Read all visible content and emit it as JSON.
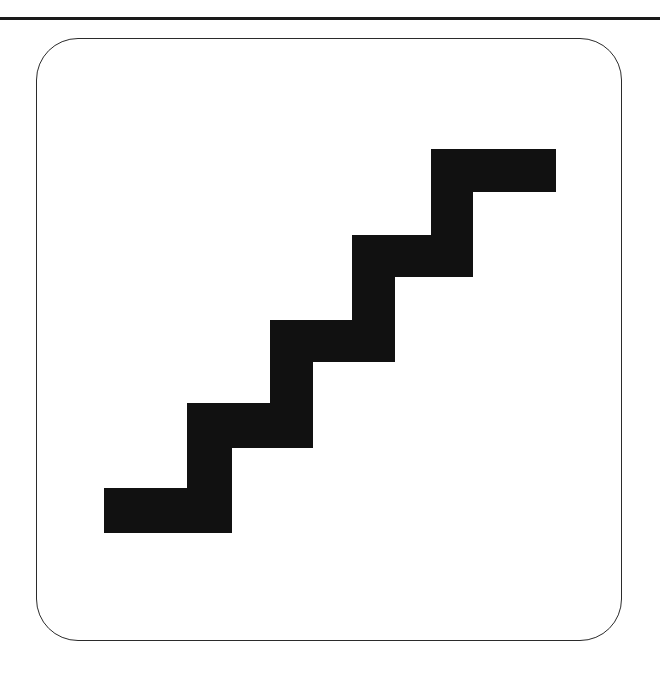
{
  "page": {
    "background_color": "#ffffff",
    "width": 660,
    "height": 678
  },
  "top_rule": {
    "name": "horizontal-divider",
    "color": "#1a1a1a",
    "thickness_px": 3,
    "y_px": 17,
    "span": "full-width"
  },
  "card": {
    "name": "rounded-panel",
    "border_color": "#2b2b2b",
    "border_width_px": 1.4,
    "corner_radius_px": 42,
    "fill_color": "#ffffff",
    "x_px": 36,
    "y_px": 38,
    "width_px": 586,
    "height_px": 603
  },
  "figure": {
    "name": "staircase-glyph",
    "label": "staircase",
    "fill_color": "#111111",
    "step_count": 5,
    "direction": "ascending-left-to-right",
    "tread_run_px": 81,
    "riser_rise_px": 85,
    "band_thickness_px": 45,
    "outline_points": "104,488 187,488 187,403 270,403 270,320 352,320 352,235 431,235 431,149 556,149 556,192 473,192 473,277 395,277 395,362 313,362 313,448 232,448 232,533 104,533",
    "bounds": {
      "left_px": 104,
      "top_px": 149,
      "right_px": 556,
      "bottom_px": 533
    }
  }
}
